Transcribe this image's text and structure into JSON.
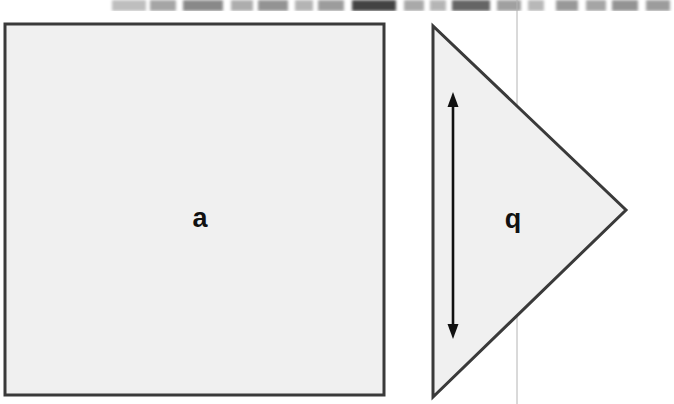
{
  "figure": {
    "background_color": "#ffffff",
    "shapes": [
      {
        "id": "square",
        "name": "square-shape",
        "kind": "square",
        "label": "a",
        "fill": "#f0f0f0",
        "stroke": "#3a3a3a",
        "stroke_width": 3,
        "x": 5,
        "y": 24,
        "width": 379,
        "height": 371,
        "label_x": 200,
        "label_y": 227
      },
      {
        "id": "triangle",
        "name": "triangle-shape",
        "kind": "triangle",
        "label": "b",
        "label_rotation": 180,
        "fill": "#f0f0f0",
        "stroke": "#3a3a3a",
        "stroke_width": 3,
        "points": "433,26 433,397 626,210",
        "label_x": 513,
        "label_y": 213
      }
    ],
    "guide_line": {
      "name": "vertical-guide-line",
      "color": "#b4b4b4",
      "stroke_width": 1,
      "x": 517,
      "y1": 0,
      "y2": 404
    },
    "dimension_arrow": {
      "name": "height-dimension-arrow",
      "color": "#111111",
      "stroke_width": 2.6,
      "x": 453,
      "y_top": 94,
      "y_bottom": 337,
      "head_width": 12,
      "head_length": 15,
      "double_headed": true
    }
  },
  "scan_artifact": {
    "name": "scan-edge-artifact",
    "description": "blurred remnant strip of the previous page line",
    "height": 11,
    "smudges": [
      {
        "left": 112,
        "width": 34,
        "opacity": 0.3
      },
      {
        "left": 150,
        "width": 26,
        "opacity": 0.42
      },
      {
        "left": 183,
        "width": 40,
        "opacity": 0.55
      },
      {
        "left": 231,
        "width": 22,
        "opacity": 0.38
      },
      {
        "left": 258,
        "width": 30,
        "opacity": 0.5
      },
      {
        "left": 295,
        "width": 18,
        "opacity": 0.35
      },
      {
        "left": 318,
        "width": 26,
        "opacity": 0.46
      },
      {
        "left": 352,
        "width": 44,
        "opacity": 0.88
      },
      {
        "left": 404,
        "width": 20,
        "opacity": 0.4
      },
      {
        "left": 430,
        "width": 16,
        "opacity": 0.34
      },
      {
        "left": 452,
        "width": 38,
        "opacity": 0.72
      },
      {
        "left": 497,
        "width": 24,
        "opacity": 0.44
      },
      {
        "left": 528,
        "width": 16,
        "opacity": 0.33
      },
      {
        "left": 556,
        "width": 22,
        "opacity": 0.48
      },
      {
        "left": 586,
        "width": 20,
        "opacity": 0.42
      },
      {
        "left": 612,
        "width": 26,
        "opacity": 0.5
      },
      {
        "left": 646,
        "width": 24,
        "opacity": 0.46
      }
    ]
  }
}
